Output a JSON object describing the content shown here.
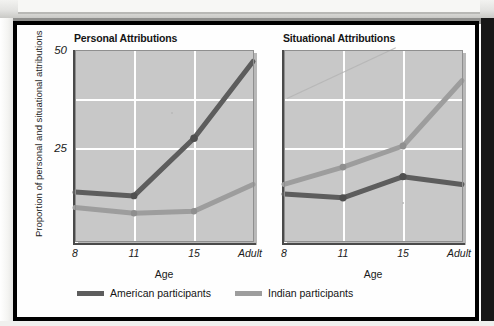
{
  "figure": {
    "ylabel": "Proportion of personal and situational attributions",
    "legend": [
      {
        "label": "American participants",
        "color": "#5d5d5d",
        "key": "american"
      },
      {
        "label": "Indian participants",
        "color": "#9d9d9d",
        "key": "indian"
      }
    ]
  },
  "chart_data": [
    {
      "type": "line",
      "title": "Personal Attributions",
      "xlabel": "Age",
      "ylabel": "Proportion of personal and situational attributions",
      "categories": [
        "8",
        "11",
        "15",
        "Adult"
      ],
      "yticks": [
        25,
        50
      ],
      "ylim": [
        0,
        50
      ],
      "grid": true,
      "legend_position": "bottom",
      "series": [
        {
          "name": "American participants",
          "color": "#5d5d5d",
          "values": [
            13,
            12,
            27,
            47
          ]
        },
        {
          "name": "Indian participants",
          "color": "#9d9d9d",
          "values": [
            9,
            7.5,
            8,
            15
          ]
        }
      ]
    },
    {
      "type": "line",
      "title": "Situational Attributions",
      "xlabel": "Age",
      "ylabel": "Proportion of personal and situational attributions",
      "categories": [
        "8",
        "11",
        "15",
        "Adult"
      ],
      "yticks": [
        25,
        50
      ],
      "ylim": [
        0,
        50
      ],
      "grid": true,
      "legend_position": "bottom",
      "series": [
        {
          "name": "American participants",
          "color": "#5d5d5d",
          "values": [
            12.5,
            11.5,
            17,
            15
          ]
        },
        {
          "name": "Indian participants",
          "color": "#9d9d9d",
          "values": [
            15,
            19.5,
            25,
            42
          ]
        }
      ]
    }
  ],
  "axis": {
    "ytick_top": "50",
    "ytick_mid": "25",
    "xticks": [
      "8",
      "11",
      "15",
      "Adult"
    ],
    "xtitle": "Age"
  },
  "panels": {
    "left_title": "Personal Attributions",
    "right_title": "Situational Attributions"
  }
}
